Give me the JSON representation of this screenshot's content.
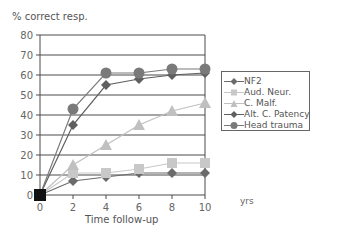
{
  "chart_data": {
    "type": "line",
    "title": "",
    "ylabel": "% correct resp.",
    "xlabel": "Time follow-up",
    "xunit": "yrs",
    "x": [
      0,
      2,
      4,
      6,
      8,
      10
    ],
    "xticks": [
      "0",
      "2",
      "4",
      "6",
      "8",
      "10"
    ],
    "yticks": [
      "0",
      "10",
      "20",
      "30",
      "40",
      "50",
      "60",
      "70",
      "80"
    ],
    "ylim": [
      0,
      80
    ],
    "xlim": [
      0,
      10
    ],
    "grid": "horizontal",
    "legend_position": "right",
    "series": [
      {
        "name": "NF2",
        "marker": "diamond",
        "color": "#6b6b6b",
        "values": [
          0,
          7,
          9,
          11,
          11,
          11
        ]
      },
      {
        "name": "Aud. Neur.",
        "marker": "square",
        "color": "#c8c8c8",
        "values": [
          0,
          11,
          11,
          13,
          16,
          16
        ]
      },
      {
        "name": "C. Malf.",
        "marker": "triangle",
        "color": "#c0c0c0",
        "values": [
          0,
          15,
          25,
          35,
          42,
          46
        ]
      },
      {
        "name": "Alt. C. Patency",
        "marker": "diamond",
        "color": "#5f5f5f",
        "values": [
          0,
          35,
          55,
          58,
          60,
          61
        ]
      },
      {
        "name": "Head trauma",
        "marker": "circle",
        "color": "#7a7a7a",
        "values": [
          0,
          43,
          61,
          61,
          63,
          63
        ]
      }
    ]
  },
  "labels": {
    "ylabel": "% correct resp.",
    "xlabel": "Time follow-up",
    "xunit": "yrs"
  },
  "legend": {
    "items": [
      "NF2",
      "Aud. Neur.",
      "C. Malf.",
      "Alt. C. Patency",
      "Head trauma"
    ]
  }
}
